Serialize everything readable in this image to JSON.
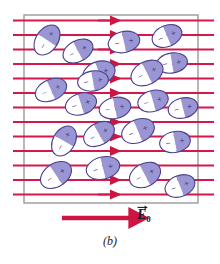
{
  "figure": {
    "panel_label": "(b)",
    "field_label_symbol": "E",
    "field_label_subscript": "0",
    "field_label_full": "E⃗0",
    "colors": {
      "field_line": "#d5174b",
      "arrow": "#cc1540",
      "box_border": "#9a9a9a",
      "dipole_outline": "#4a3f8f",
      "dipole_positive_fill": "#9a96d4",
      "dipole_negative_fill": "#ffffff",
      "sign_glyph": "#2a2170",
      "label_text": "#1b1b2f",
      "background": "#ffffff"
    }
  },
  "chart_data": {
    "type": "diagram",
    "title": "(b)",
    "xlabel": "",
    "ylabel": "",
    "legend": [
      "E⃗0"
    ],
    "annotations": [
      "E⃗0",
      "(b)"
    ],
    "box": {
      "x": 24,
      "y": 15,
      "width": 174,
      "height": 188
    },
    "field_lines": {
      "count": 13,
      "x_start": 13,
      "x_end": 214,
      "arrow_x": 112,
      "y_values": [
        20.5,
        35.0,
        49.5,
        64.0,
        78.5,
        93.0,
        107.5,
        122.0,
        136.5,
        151.0,
        165.5,
        180.0,
        194.5
      ],
      "stroke_width": 1.9,
      "direction": "left-to-right"
    },
    "field_arrow_legend": {
      "x1": 62,
      "y1": 218,
      "x2": 131,
      "y2": 218
    },
    "dipoles": [
      {
        "cx": 47,
        "cy": 40,
        "rx": 16.5,
        "ry": 11.0,
        "angle": -56,
        "neg": "−",
        "pos": "+"
      },
      {
        "cx": 78,
        "cy": 51,
        "rx": 16.0,
        "ry": 10.5,
        "angle": -28,
        "neg": "−",
        "pos": "+"
      },
      {
        "cx": 124,
        "cy": 42,
        "rx": 16.0,
        "ry": 10.5,
        "angle": -13,
        "neg": "−",
        "pos": "+"
      },
      {
        "cx": 167,
        "cy": 36,
        "rx": 15.5,
        "ry": 10.5,
        "angle": -23,
        "neg": "−",
        "pos": "+"
      },
      {
        "cx": 99,
        "cy": 73,
        "rx": 16.5,
        "ry": 11.5,
        "angle": -19,
        "neg": "−",
        "pos": "+"
      },
      {
        "cx": 172,
        "cy": 63,
        "rx": 15.5,
        "ry": 10.0,
        "angle": -9,
        "neg": "−",
        "pos": "+"
      },
      {
        "cx": 51,
        "cy": 90,
        "rx": 16.5,
        "ry": 10.5,
        "angle": -24,
        "neg": "−",
        "pos": "+"
      },
      {
        "cx": 93,
        "cy": 81,
        "rx": 15.5,
        "ry": 10.0,
        "angle": -10,
        "neg": "−",
        "pos": "+"
      },
      {
        "cx": 147,
        "cy": 73,
        "rx": 17.0,
        "ry": 11.5,
        "angle": -27,
        "neg": "−",
        "pos": "+"
      },
      {
        "cx": 81,
        "cy": 104,
        "rx": 16.0,
        "ry": 10.5,
        "angle": -18,
        "neg": "−",
        "pos": "+"
      },
      {
        "cx": 115,
        "cy": 108,
        "rx": 16.0,
        "ry": 10.5,
        "angle": -12,
        "neg": "−",
        "pos": "+"
      },
      {
        "cx": 153,
        "cy": 101,
        "rx": 15.5,
        "ry": 10.5,
        "angle": -16,
        "neg": "−",
        "pos": "+"
      },
      {
        "cx": 183,
        "cy": 108,
        "rx": 15.0,
        "ry": 10.0,
        "angle": -14,
        "neg": "−",
        "pos": "+"
      },
      {
        "cx": 64,
        "cy": 141,
        "rx": 16.0,
        "ry": 11.0,
        "angle": -60,
        "neg": "−",
        "pos": "+"
      },
      {
        "cx": 99,
        "cy": 134,
        "rx": 16.5,
        "ry": 11.0,
        "angle": -30,
        "neg": "−",
        "pos": "+"
      },
      {
        "cx": 138,
        "cy": 131,
        "rx": 17.0,
        "ry": 11.5,
        "angle": -23,
        "neg": "−",
        "pos": "+"
      },
      {
        "cx": 175,
        "cy": 142,
        "rx": 15.5,
        "ry": 10.5,
        "angle": -11,
        "neg": "−",
        "pos": "+"
      },
      {
        "cx": 56,
        "cy": 175,
        "rx": 17.0,
        "ry": 11.5,
        "angle": -34,
        "neg": "−",
        "pos": "+"
      },
      {
        "cx": 103,
        "cy": 168,
        "rx": 17.0,
        "ry": 11.0,
        "angle": -14,
        "neg": "−",
        "pos": "+"
      },
      {
        "cx": 145,
        "cy": 175,
        "rx": 16.5,
        "ry": 11.5,
        "angle": -28,
        "neg": "−",
        "pos": "+"
      },
      {
        "cx": 180,
        "cy": 186,
        "rx": 15.5,
        "ry": 10.5,
        "angle": -22,
        "neg": "−",
        "pos": "+"
      }
    ]
  }
}
